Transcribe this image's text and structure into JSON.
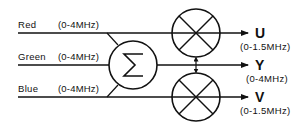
{
  "diagram": {
    "title": "",
    "inputs": [
      {
        "name": "Red",
        "band": "(0-4MHz)"
      },
      {
        "name": "Green",
        "band": "(0-4MHz)"
      },
      {
        "name": "Blue",
        "band": "(0-4MHz)"
      }
    ],
    "summer": {
      "symbol": "Σ",
      "icon": "summation-icon"
    },
    "multipliers": [
      {
        "icon": "multiplier-icon",
        "output": "U"
      },
      {
        "icon": "multiplier-icon",
        "output": "V"
      }
    ],
    "outputs": [
      {
        "name": "U",
        "band": "(0-1.5MHz)"
      },
      {
        "name": "Y",
        "band": "(0-4MHz)"
      },
      {
        "name": "V",
        "band": "(0-1.5MHz)"
      }
    ],
    "colors": {
      "stroke": "#111111",
      "background": "#ffffff"
    }
  }
}
